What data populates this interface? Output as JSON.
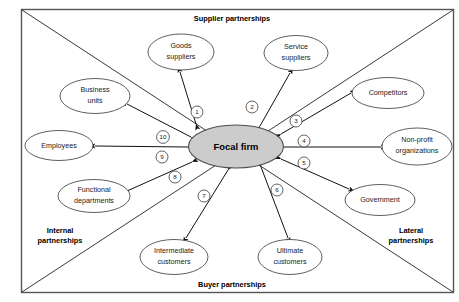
{
  "diagram": {
    "frame": {
      "stroke_color": "#555555",
      "background_color": "#ffffff"
    },
    "focal": {
      "label": "Focal firm",
      "fill_color": "#cccccc",
      "stroke_color": "#4d4d4d"
    },
    "quadrant_labels": [
      {
        "id": "supplier",
        "label": "Supplier partnerships",
        "position": "top"
      },
      {
        "id": "buyer",
        "label": "Buyer partnerships",
        "position": "bottom"
      },
      {
        "id": "internal",
        "label": "Internal\npartnerships",
        "line1": "Internal",
        "line2": "partnerships",
        "position": "left-bottom"
      },
      {
        "id": "lateral",
        "label": "Lateral\npartnerships",
        "line1": "Lateral",
        "line2": "partnerships",
        "position": "right-bottom"
      }
    ],
    "nodes": [
      {
        "id": "goods-suppliers",
        "line1": "Goods",
        "line2": "suppliers",
        "group": "supplier"
      },
      {
        "id": "service-suppliers",
        "line1": "Service",
        "line2": "suppliers",
        "group": "supplier"
      },
      {
        "id": "competitors",
        "line1": "Competitors",
        "line2": "",
        "group": "lateral"
      },
      {
        "id": "non-profit-organizations",
        "line1": "Non-profit",
        "line2": "organizations",
        "group": "lateral"
      },
      {
        "id": "government",
        "line1": "Government",
        "line2": "",
        "group": "lateral"
      },
      {
        "id": "ultimate-customers",
        "line1": "Ultimate",
        "line2": "customers",
        "group": "buyer"
      },
      {
        "id": "intermediate-customers",
        "line1": "Intermediate",
        "line2": "customers",
        "group": "buyer"
      },
      {
        "id": "functional-departments",
        "line1": "Functional",
        "line2": "departments",
        "group": "internal"
      },
      {
        "id": "employees",
        "line1": "Employees",
        "line2": "",
        "group": "internal"
      },
      {
        "id": "business-units",
        "line1": "Business",
        "line2": "units",
        "group": "internal"
      }
    ],
    "connector_numbers": [
      {
        "id": "connector-1",
        "number": "1",
        "to": "goods-suppliers"
      },
      {
        "id": "connector-2",
        "number": "2",
        "to": "service-suppliers"
      },
      {
        "id": "connector-3",
        "number": "3",
        "to": "competitors"
      },
      {
        "id": "connector-4",
        "number": "4",
        "to": "non-profit-organizations"
      },
      {
        "id": "connector-5",
        "number": "5",
        "to": "government"
      },
      {
        "id": "connector-6",
        "number": "6",
        "to": "ultimate-customers"
      },
      {
        "id": "connector-7",
        "number": "7",
        "to": "intermediate-customers"
      },
      {
        "id": "connector-8",
        "number": "8",
        "to": "functional-departments"
      },
      {
        "id": "connector-9",
        "number": "9",
        "to": "employees"
      },
      {
        "id": "connector-10",
        "number": "10",
        "to": "business-units"
      }
    ]
  }
}
